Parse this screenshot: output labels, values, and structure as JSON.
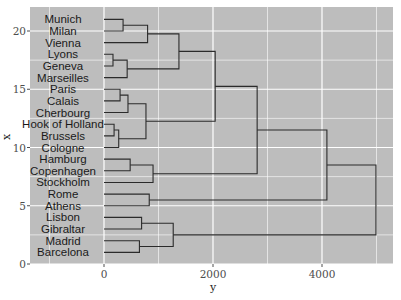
{
  "chart_data": {
    "type": "dendrogram",
    "title": "",
    "xlabel": "y",
    "ylabel": "x",
    "orientation": "horizontal",
    "xlim": [
      -1900,
      5500
    ],
    "ylim": [
      0,
      22
    ],
    "x_ticks": [
      0,
      2000,
      4000
    ],
    "x_tick_labels": [
      "0",
      "2000",
      "4000"
    ],
    "y_ticks": [
      0,
      5,
      10,
      15,
      20
    ],
    "y_tick_labels": [
      "0",
      "5",
      "10",
      "15",
      "20"
    ],
    "grid": true,
    "panel_background": "#bdbdbd",
    "grid_color": "#ffffff",
    "line_color": "#2b2b2b",
    "leaves": [
      {
        "label": "Munich",
        "pos": 21
      },
      {
        "label": "Milan",
        "pos": 20
      },
      {
        "label": "Vienna",
        "pos": 19
      },
      {
        "label": "Lyons",
        "pos": 18
      },
      {
        "label": "Geneva",
        "pos": 17
      },
      {
        "label": "Marseilles",
        "pos": 16
      },
      {
        "label": "Paris",
        "pos": 15
      },
      {
        "label": "Calais",
        "pos": 14
      },
      {
        "label": "Cherbourg",
        "pos": 13
      },
      {
        "label": "Hook of Holland",
        "pos": 12
      },
      {
        "label": "Brussels",
        "pos": 11
      },
      {
        "label": "Cologne",
        "pos": 10
      },
      {
        "label": "Hamburg",
        "pos": 9
      },
      {
        "label": "Copenhagen",
        "pos": 8
      },
      {
        "label": "Stockholm",
        "pos": 7
      },
      {
        "label": "Rome",
        "pos": 6
      },
      {
        "label": "Athens",
        "pos": 5
      },
      {
        "label": "Lisbon",
        "pos": 4
      },
      {
        "label": "Gibraltar",
        "pos": 3
      },
      {
        "label": "Madrid",
        "pos": 2
      },
      {
        "label": "Barcelona",
        "pos": 1
      }
    ],
    "merges": [
      {
        "a": 21,
        "b": 20,
        "height": 350,
        "pos": 20.5
      },
      {
        "a": 20.5,
        "b": 19,
        "height": 800,
        "pos": 19.75
      },
      {
        "a": 18,
        "b": 17,
        "height": 165,
        "pos": 17.5
      },
      {
        "a": 17.5,
        "b": 16,
        "height": 425,
        "pos": 16.75
      },
      {
        "a": 19.75,
        "b": 16.75,
        "height": 1375,
        "pos": 18.25
      },
      {
        "a": 15,
        "b": 14,
        "height": 295,
        "pos": 14.5
      },
      {
        "a": 14.5,
        "b": 13,
        "height": 440,
        "pos": 13.75
      },
      {
        "a": 12,
        "b": 11,
        "height": 185,
        "pos": 11.5
      },
      {
        "a": 11.5,
        "b": 10,
        "height": 270,
        "pos": 10.75
      },
      {
        "a": 13.75,
        "b": 10.75,
        "height": 770,
        "pos": 12.25
      },
      {
        "a": 18.25,
        "b": 12.25,
        "height": 2040,
        "pos": 15.25
      },
      {
        "a": 9,
        "b": 8,
        "height": 480,
        "pos": 8.5
      },
      {
        "a": 8.5,
        "b": 7,
        "height": 900,
        "pos": 7.75
      },
      {
        "a": 15.25,
        "b": 7.75,
        "height": 2810,
        "pos": 11.5
      },
      {
        "a": 6,
        "b": 5,
        "height": 830,
        "pos": 5.5
      },
      {
        "a": 11.5,
        "b": 5.5,
        "height": 4090,
        "pos": 8.5
      },
      {
        "a": 4,
        "b": 3,
        "height": 690,
        "pos": 3.5
      },
      {
        "a": 2,
        "b": 1,
        "height": 650,
        "pos": 1.5
      },
      {
        "a": 3.5,
        "b": 1.5,
        "height": 1270,
        "pos": 2.5
      },
      {
        "a": 8.5,
        "b": 2.5,
        "height": 4990,
        "pos": 5.5
      }
    ]
  }
}
